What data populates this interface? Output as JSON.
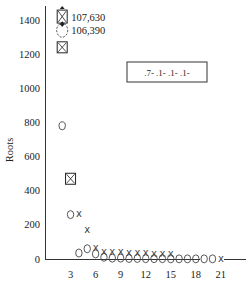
{
  "chart_data": {
    "type": "scatter",
    "title": "",
    "xlabel": "",
    "ylabel": "Roots",
    "xlim": [
      0,
      24
    ],
    "ylim": [
      0,
      1450
    ],
    "grid": false,
    "x_ticks": [
      3,
      6,
      9,
      12,
      15,
      18,
      21
    ],
    "y_ticks": [
      0,
      200,
      400,
      600,
      800,
      1000,
      1200,
      1400
    ],
    "legend": {
      "position": "upper right",
      "entries": [
        ".7-",
        ".1-",
        ".1-",
        ".1-"
      ]
    },
    "series": [
      {
        "name": "circle",
        "marker": "circle",
        "points": [
          {
            "x": 2,
            "y": 780
          },
          {
            "x": 3,
            "y": 260
          },
          {
            "x": 4,
            "y": 35
          },
          {
            "x": 5,
            "y": 60
          },
          {
            "x": 6,
            "y": 30
          },
          {
            "x": 7,
            "y": 10
          },
          {
            "x": 8,
            "y": 5
          },
          {
            "x": 9,
            "y": 5
          },
          {
            "x": 10,
            "y": 3
          },
          {
            "x": 11,
            "y": 3
          },
          {
            "x": 12,
            "y": 2
          },
          {
            "x": 13,
            "y": 2
          },
          {
            "x": 14,
            "y": 2
          },
          {
            "x": 15,
            "y": 1
          },
          {
            "x": 16,
            "y": 1
          },
          {
            "x": 17,
            "y": 1
          },
          {
            "x": 18,
            "y": 1
          },
          {
            "x": 19,
            "y": 1
          },
          {
            "x": 20,
            "y": 1
          }
        ]
      },
      {
        "name": "x",
        "marker": "x",
        "points": [
          {
            "x": 4,
            "y": 265
          },
          {
            "x": 5,
            "y": 170
          },
          {
            "x": 6,
            "y": 65
          },
          {
            "x": 7,
            "y": 45
          },
          {
            "x": 8,
            "y": 45
          },
          {
            "x": 9,
            "y": 45
          },
          {
            "x": 10,
            "y": 40
          },
          {
            "x": 11,
            "y": 40
          },
          {
            "x": 12,
            "y": 40
          },
          {
            "x": 13,
            "y": 35
          },
          {
            "x": 14,
            "y": 35
          },
          {
            "x": 15,
            "y": 35
          },
          {
            "x": 21,
            "y": 5
          }
        ]
      },
      {
        "name": "boxed-x",
        "marker": "boxed-x",
        "points": [
          {
            "x": 2,
            "y": 1420,
            "label": "107,630",
            "offscale": true
          },
          {
            "x": 2,
            "y": 1240
          },
          {
            "x": 3,
            "y": 470
          }
        ]
      },
      {
        "name": "dashed-circle",
        "marker": "dashed-circle",
        "points": [
          {
            "x": 2,
            "y": 1340,
            "label": "106,390",
            "offscale": true
          }
        ]
      }
    ],
    "annotations": [
      "107,630",
      "106,390"
    ]
  }
}
